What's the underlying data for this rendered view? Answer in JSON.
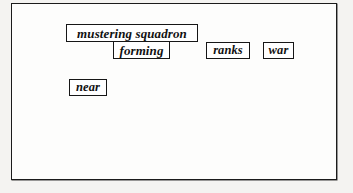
{
  "figure": {
    "frame_label": "detected-word-boxes-figure",
    "background_color": "#fdfdfc",
    "border_color": "#1b1b1b",
    "page_color": "#f2f1ef"
  },
  "word_boxes": [
    {
      "id": "mustering-squadron",
      "text": "mustering squadron",
      "x": 54,
      "y": 20,
      "width": 132,
      "height": 18,
      "row": 1
    },
    {
      "id": "forming",
      "text": "forming",
      "x": 101,
      "y": 37,
      "width": 57,
      "height": 18,
      "row": 2
    },
    {
      "id": "ranks",
      "text": "ranks",
      "x": 194,
      "y": 38,
      "width": 44,
      "height": 17,
      "row": 2
    },
    {
      "id": "war",
      "text": "war",
      "x": 251,
      "y": 38,
      "width": 31,
      "height": 17,
      "row": 2
    },
    {
      "id": "near",
      "text": "near",
      "x": 57,
      "y": 75,
      "width": 38,
      "height": 17,
      "row": 3
    }
  ]
}
